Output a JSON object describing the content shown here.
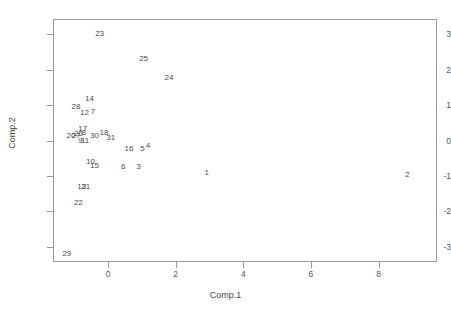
{
  "top_artifact": "",
  "chart_data": {
    "type": "scatter",
    "title": "",
    "xlabel": "Comp.1",
    "ylabel": "Comp.2",
    "xlim": [
      -1.6,
      9.7
    ],
    "ylim": [
      -3.4,
      3.4
    ],
    "xticks": [
      0,
      2,
      4,
      6,
      8
    ],
    "yticks": [
      -3,
      -2,
      -1,
      0,
      1,
      2,
      3
    ],
    "xtick_labels": [
      "0",
      "2",
      "4",
      "6",
      "8"
    ],
    "ytick_labels": [
      "-3",
      "-2",
      "-1",
      "0",
      "1",
      "2",
      "3"
    ],
    "grid": false,
    "legend": false,
    "marker": "text-label",
    "point_color": "#4a4a4a",
    "frame_color": "#9a9a9a",
    "points": [
      {
        "label": "23",
        "x": -0.25,
        "y": 3.0
      },
      {
        "label": "25",
        "x": 1.05,
        "y": 2.3
      },
      {
        "label": "24",
        "x": 1.8,
        "y": 1.75
      },
      {
        "label": "14",
        "x": -0.55,
        "y": 1.18
      },
      {
        "label": "28",
        "x": -0.95,
        "y": 0.95
      },
      {
        "label": "12",
        "x": -0.7,
        "y": 0.78
      },
      {
        "label": "7",
        "x": -0.45,
        "y": 0.8
      },
      {
        "label": "17",
        "x": -0.75,
        "y": 0.33
      },
      {
        "label": "8",
        "x": -0.72,
        "y": 0.2
      },
      {
        "label": "26",
        "x": -0.88,
        "y": 0.18
      },
      {
        "label": "27",
        "x": -0.95,
        "y": 0.12
      },
      {
        "label": "20",
        "x": -1.1,
        "y": 0.12
      },
      {
        "label": "9",
        "x": -0.82,
        "y": 0.0
      },
      {
        "label": "11",
        "x": -0.68,
        "y": -0.02
      },
      {
        "label": "30",
        "x": -0.4,
        "y": 0.12
      },
      {
        "label": "18",
        "x": -0.12,
        "y": 0.2
      },
      {
        "label": "31",
        "x": 0.08,
        "y": 0.08
      },
      {
        "label": "16",
        "x": 0.62,
        "y": -0.25
      },
      {
        "label": "5",
        "x": 1.02,
        "y": -0.25
      },
      {
        "label": "4",
        "x": 1.18,
        "y": -0.15
      },
      {
        "label": "10",
        "x": -0.52,
        "y": -0.6
      },
      {
        "label": "15",
        "x": -0.4,
        "y": -0.72
      },
      {
        "label": "6",
        "x": 0.45,
        "y": -0.75
      },
      {
        "label": "3",
        "x": 0.9,
        "y": -0.75
      },
      {
        "label": "1",
        "x": 2.92,
        "y": -0.92
      },
      {
        "label": "2",
        "x": 8.85,
        "y": -0.98
      },
      {
        "label": "13",
        "x": -0.78,
        "y": -1.32
      },
      {
        "label": "21",
        "x": -0.66,
        "y": -1.32
      },
      {
        "label": "22",
        "x": -0.88,
        "y": -1.75
      },
      {
        "label": "29",
        "x": -1.22,
        "y": -3.2
      }
    ]
  }
}
